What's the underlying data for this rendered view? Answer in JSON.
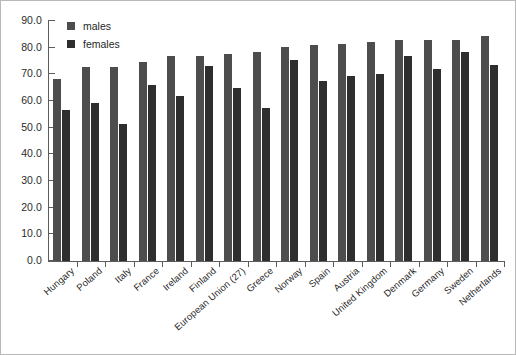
{
  "chart_data": {
    "type": "bar",
    "title": "",
    "subtitle": "",
    "xlabel": "",
    "ylabel": "",
    "ylim": [
      0.0,
      90.0
    ],
    "ytick_step": 10.0,
    "ytick_labels": [
      "0.0",
      "10.0",
      "20.0",
      "30.0",
      "40.0",
      "50.0",
      "60.0",
      "70.0",
      "80.0",
      "90.0"
    ],
    "grid": false,
    "legend_position": "top-left",
    "categories": [
      "Hungary",
      "Poland",
      "Italy",
      "France",
      "Ireland",
      "Finland",
      "European Union (27)",
      "Greece",
      "Norway",
      "Spain",
      "Austria",
      "United Kingdom",
      "Denmark",
      "Germany",
      "Sweden",
      "Netherlands"
    ],
    "series": [
      {
        "name": "males",
        "color": "#4d4d4d",
        "values": [
          68.2,
          72.8,
          72.8,
          74.8,
          76.8,
          76.8,
          77.7,
          78.5,
          80.2,
          81.0,
          81.4,
          82.0,
          82.8,
          82.8,
          83.0,
          84.2
        ]
      },
      {
        "name": "females",
        "color": "#2e2e2e",
        "values": [
          56.6,
          59.3,
          51.2,
          66.0,
          62.0,
          73.0,
          65.0,
          57.4,
          75.4,
          67.5,
          69.4,
          70.2,
          76.8,
          72.1,
          78.2,
          73.4
        ]
      }
    ],
    "annotations": []
  },
  "legend": {
    "items": [
      {
        "label": "males",
        "swatch": "males"
      },
      {
        "label": "females",
        "swatch": "females"
      }
    ]
  }
}
